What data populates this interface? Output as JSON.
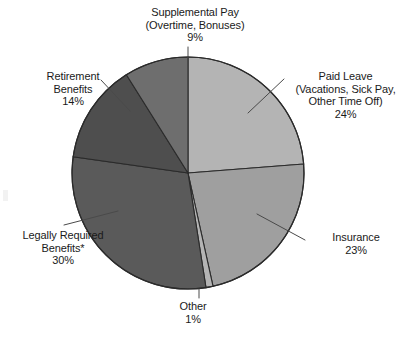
{
  "chart_data": {
    "type": "pie",
    "title": "",
    "categories": [
      "Paid Leave (Vacations, Sick Pay, Other Time Off)",
      "Insurance",
      "Other",
      "Legally Required Benefits*",
      "Retirement Benefits",
      "Supplemental Pay (Overtime, Bonuses)"
    ],
    "values": [
      24,
      23,
      1,
      30,
      14,
      9
    ],
    "unit": "percent",
    "legend": "none",
    "labels_placement": "callout-with-leader-lines",
    "start_angle_deg": 0,
    "direction": "clockwise",
    "slices": [
      {
        "name": "paid-leave",
        "label_line1": "Paid Leave",
        "label_line2": "(Vacations, Sick Pay,",
        "label_line3": "Other Time Off)",
        "percent_text": "24%",
        "value": 24,
        "color": "#b4b4b4"
      },
      {
        "name": "insurance",
        "label_line1": "Insurance",
        "percent_text": "23%",
        "value": 23,
        "color": "#9f9f9f"
      },
      {
        "name": "other",
        "label_line1": "Other",
        "percent_text": "1%",
        "value": 1,
        "color": "#b4b4b4"
      },
      {
        "name": "legally-required-benefits",
        "label_line1": "Legally Required",
        "label_line2": "Benefits*",
        "percent_text": "30%",
        "value": 30,
        "color": "#5a5a5a"
      },
      {
        "name": "retirement-benefits",
        "label_line1": "Retirement",
        "label_line2": "Benefits",
        "percent_text": "14%",
        "value": 14,
        "color": "#4e4e4e"
      },
      {
        "name": "supplemental-pay",
        "label_line1": "Supplemental Pay",
        "label_line2": "(Overtime, Bonuses)",
        "percent_text": "9%",
        "value": 9,
        "color": "#6e6e6e"
      }
    ],
    "colors": {
      "paid_leave": "#b4b4b4",
      "insurance": "#9f9f9f",
      "other": "#b4b4b4",
      "legally_required": "#5a5a5a",
      "retirement": "#4e4e4e",
      "supplemental_pay": "#6e6e6e",
      "outline": "#2b2b2b",
      "leader_line": "#4a4a4a",
      "text": "#1a1a1a",
      "background": "#ffffff"
    }
  }
}
